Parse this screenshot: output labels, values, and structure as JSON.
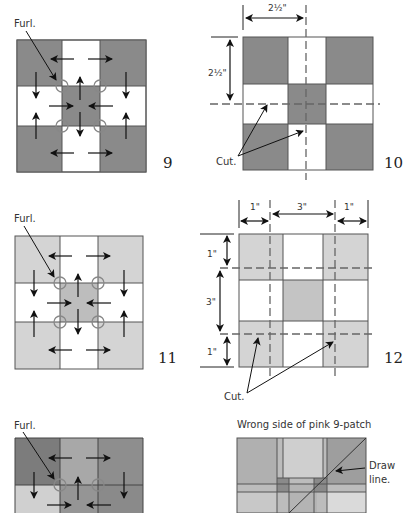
{
  "diagram_9": {
    "label": "Furl.",
    "step_number": "9",
    "colors": {
      "dark": "#8a8a8a",
      "light": "#ffffff"
    }
  },
  "diagram_10": {
    "top_dimension": "2½\"",
    "side_dimension": "2½\"",
    "cut_label": "Cut.",
    "step_number": "10"
  },
  "diagram_11": {
    "label": "Furl.",
    "step_number": "11",
    "colors": {
      "light_gray": "#d4d4d4",
      "center": "#bdbdbd",
      "light": "#ffffff"
    }
  },
  "diagram_12": {
    "top_dimensions": [
      "1\"",
      "3\"",
      "1\""
    ],
    "side_dimensions": [
      "1\"",
      "3\"",
      "1\""
    ],
    "cut_label": "Cut.",
    "step_number": "12"
  },
  "diagram_13": {
    "label": "Furl."
  },
  "diagram_14": {
    "title": "Wrong side of pink 9-patch",
    "draw_label_line1": "Draw",
    "draw_label_line2": "line."
  }
}
